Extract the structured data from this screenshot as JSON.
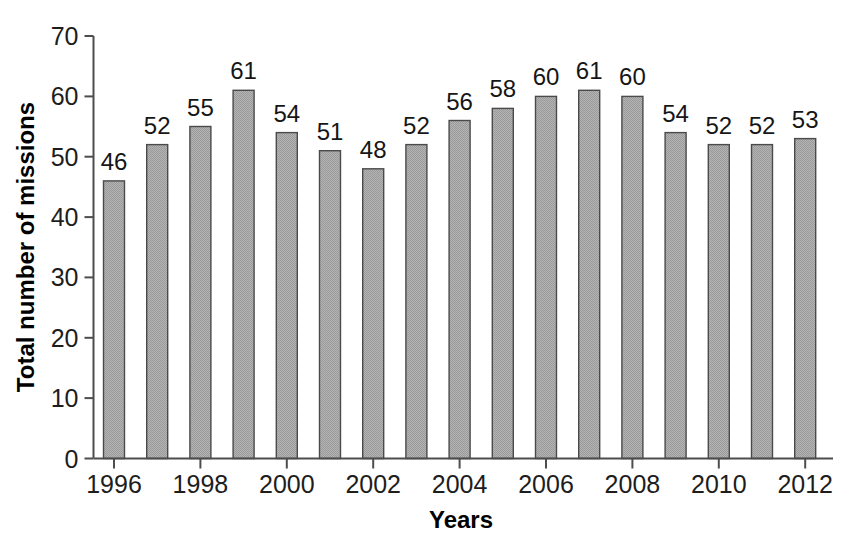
{
  "chart_data": {
    "type": "bar",
    "title": "",
    "xlabel": "Years",
    "ylabel": "Total number of missions",
    "categories": [
      1996,
      1997,
      1998,
      1999,
      2000,
      2001,
      2002,
      2003,
      2004,
      2005,
      2006,
      2007,
      2008,
      2009,
      2010,
      2011,
      2012
    ],
    "values": [
      46,
      52,
      55,
      61,
      54,
      51,
      48,
      52,
      56,
      58,
      60,
      61,
      60,
      54,
      52,
      52,
      53
    ],
    "value_labels": [
      "46",
      "52",
      "55",
      "61",
      "54",
      "51",
      "48",
      "52",
      "56",
      "58",
      "60",
      "61",
      "60",
      "54",
      "52",
      "52",
      "53"
    ],
    "x_tick_labels": [
      "1996",
      "1998",
      "2000",
      "2002",
      "2004",
      "2006",
      "2008",
      "2010",
      "2012"
    ],
    "x_tick_categories": [
      1996,
      1998,
      2000,
      2002,
      2004,
      2006,
      2008,
      2010,
      2012
    ],
    "y_tick_labels": [
      "0",
      "10",
      "20",
      "30",
      "40",
      "50",
      "60",
      "70"
    ],
    "y_ticks": [
      0,
      10,
      20,
      30,
      40,
      50,
      60,
      70
    ],
    "ylim": [
      0,
      70
    ],
    "grid": false,
    "legend": false,
    "legend_position": "none",
    "bar_fill_color": "#a9a9a9",
    "bar_edge_color": "#4a4a4a",
    "axis_color": "#4d4d4d",
    "text_color": "#1a1a1a",
    "background_color": "#ffffff"
  }
}
